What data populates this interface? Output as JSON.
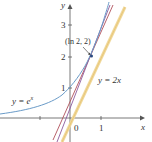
{
  "figure": {
    "axes": {
      "x_label": "x",
      "y_label": "y",
      "origin_label": "0",
      "x_ticks": [
        "1"
      ],
      "y_ticks": [
        "1",
        "2",
        "3"
      ]
    },
    "curves": [
      {
        "name": "exponential",
        "label": "y = e^x",
        "label_text_main": "y = e",
        "label_exp": "x",
        "color": "#6a9bc8"
      },
      {
        "name": "line-2x",
        "label": "y = 2x",
        "color": "#e8c77a"
      },
      {
        "name": "tangent-line",
        "label": "",
        "color": "#8c5a9c"
      },
      {
        "name": "secant-line",
        "label": "",
        "color": "#b0505a"
      }
    ],
    "point": {
      "label": "(ln 2, 2)",
      "x": 0.693,
      "y": 2
    }
  }
}
